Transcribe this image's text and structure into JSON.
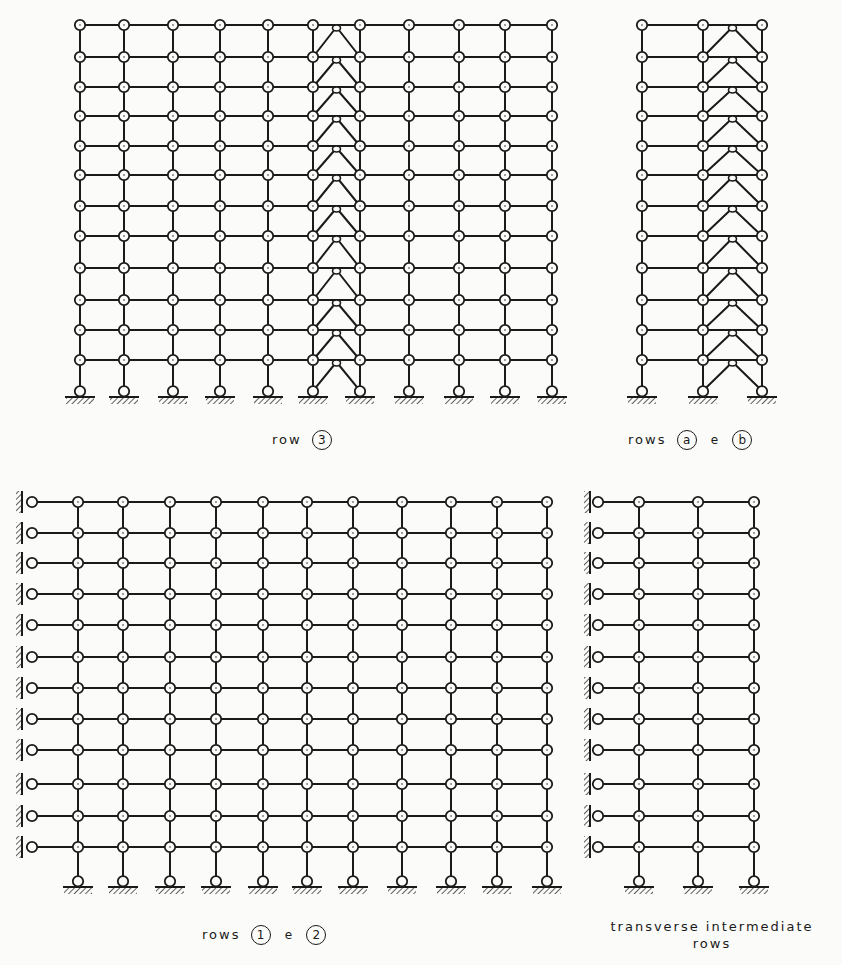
{
  "figure": {
    "stroke_color": "#1a1a1a",
    "background": "#fbfbf9"
  },
  "frames": [
    {
      "id": "row3",
      "caption": {
        "prefix": "row",
        "markers": [
          "3"
        ],
        "joiner": ""
      },
      "columns_x": [
        80,
        124,
        173,
        220,
        268,
        313,
        360,
        409,
        459,
        505,
        552
      ],
      "floors_y": [
        25,
        57,
        87,
        116,
        146,
        175,
        206,
        236,
        268,
        300,
        330,
        360
      ],
      "base_y": 396,
      "braced_bay": [
        5,
        6
      ],
      "side_supports": false
    },
    {
      "id": "rows-a-b",
      "caption": {
        "prefix": "rows",
        "markers": [
          "a",
          "b"
        ],
        "joiner": "e"
      },
      "columns_x": [
        642,
        703,
        762
      ],
      "floors_y": [
        25,
        57,
        87,
        116,
        146,
        175,
        206,
        236,
        268,
        300,
        330,
        360
      ],
      "base_y": 396,
      "braced_bay": [
        1,
        2
      ],
      "side_supports": false
    },
    {
      "id": "rows-1-2",
      "caption": {
        "prefix": "rows",
        "markers": [
          "1",
          "2"
        ],
        "joiner": "e"
      },
      "wall_x": 22,
      "wall_node_x": 32,
      "columns_x": [
        78,
        123,
        170,
        216,
        263,
        307,
        353,
        402,
        451,
        497,
        547
      ],
      "floors_y": [
        502,
        533,
        563,
        594,
        625,
        657,
        688,
        719,
        750,
        784,
        816,
        847
      ],
      "base_y": 886,
      "braced_bay": null,
      "side_supports": true
    },
    {
      "id": "transverse",
      "caption": {
        "line1": "transverse intermediate",
        "line2": "rows"
      },
      "wall_x": 590,
      "wall_node_x": 598,
      "columns_x": [
        639,
        698,
        754
      ],
      "floors_y": [
        502,
        533,
        563,
        594,
        625,
        657,
        688,
        719,
        750,
        784,
        816,
        847
      ],
      "base_y": 886,
      "braced_bay": null,
      "side_supports": true
    }
  ],
  "captions": {
    "row3": {
      "word": "row",
      "m1": "3"
    },
    "rows_ab": {
      "word": "rows",
      "m1": "a",
      "joiner": "e",
      "m2": "b"
    },
    "rows_12": {
      "word": "rows",
      "m1": "1",
      "joiner": "e",
      "m2": "2"
    },
    "transverse": {
      "line1": "transverse intermediate",
      "line2": "rows"
    }
  }
}
